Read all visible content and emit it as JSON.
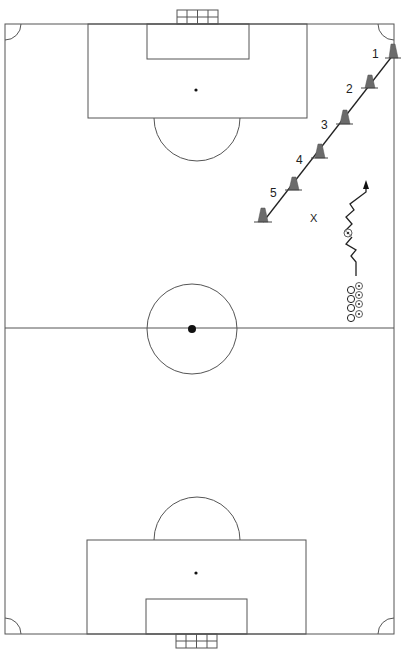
{
  "diagram": {
    "type": "soccer-drill",
    "field": {
      "orientation": "vertical",
      "line_color": "#555555"
    },
    "cones": [
      {
        "label": "1",
        "x": 393,
        "y": 58
      },
      {
        "label": "2",
        "x": 370,
        "y": 88
      },
      {
        "label": "3",
        "x": 345,
        "y": 124
      },
      {
        "label": "4",
        "x": 320,
        "y": 158
      },
      {
        "label": "5",
        "x": 294,
        "y": 190
      },
      {
        "label": "",
        "x": 263,
        "y": 222
      }
    ],
    "player_x_label": "X",
    "players_queue": [
      {
        "marker": "O"
      },
      {
        "marker": "O"
      },
      {
        "marker": "O"
      },
      {
        "marker": "O"
      }
    ],
    "cone_color": "#6b6b6b"
  }
}
